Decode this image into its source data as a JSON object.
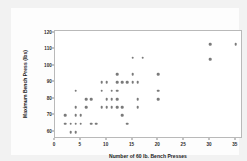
{
  "chart_data": {
    "type": "scatter",
    "title": "",
    "xlabel": "Number of 60 lb. Bench Presses",
    "ylabel": "Maximum Bench Press (lbs)",
    "xlim": [
      0,
      36
    ],
    "ylim": [
      57,
      121
    ],
    "grid": false,
    "legend": null,
    "marker_color": "#7a7a7a",
    "marker_shape": "circle",
    "xticks": [
      0,
      5,
      10,
      15,
      20,
      25,
      30,
      35
    ],
    "xtick_labels": [
      "0",
      "5",
      "10",
      "15",
      "20",
      "25",
      "30",
      "35"
    ],
    "yticks": [
      60,
      70,
      80,
      90,
      100,
      110,
      120
    ],
    "ytick_labels": [
      "60",
      "70",
      "80",
      "90",
      "100",
      "110",
      "120"
    ],
    "series": [
      {
        "name": "Bench press data",
        "points": [
          [
            2,
            70
          ],
          [
            2,
            65
          ],
          [
            3,
            65
          ],
          [
            3,
            60
          ],
          [
            4,
            85
          ],
          [
            4,
            75
          ],
          [
            4,
            70
          ],
          [
            4,
            65
          ],
          [
            4,
            60
          ],
          [
            5,
            70
          ],
          [
            5,
            65
          ],
          [
            6,
            80
          ],
          [
            6,
            75
          ],
          [
            7,
            80
          ],
          [
            7,
            65
          ],
          [
            8,
            65
          ],
          [
            9,
            85
          ],
          [
            9,
            90
          ],
          [
            9,
            75
          ],
          [
            10,
            90
          ],
          [
            10,
            80
          ],
          [
            10,
            75
          ],
          [
            11,
            85
          ],
          [
            11,
            80
          ],
          [
            11,
            75
          ],
          [
            12,
            95
          ],
          [
            12,
            90
          ],
          [
            12,
            85
          ],
          [
            12,
            80
          ],
          [
            12,
            75
          ],
          [
            13,
            90
          ],
          [
            13,
            70
          ],
          [
            13,
            75
          ],
          [
            14,
            90
          ],
          [
            14,
            65
          ],
          [
            15,
            95
          ],
          [
            15,
            90
          ],
          [
            15,
            105
          ],
          [
            16,
            90
          ],
          [
            16,
            80
          ],
          [
            16,
            75
          ],
          [
            17,
            105
          ],
          [
            20,
            95
          ],
          [
            20,
            85
          ],
          [
            20,
            80
          ],
          [
            30,
            113
          ],
          [
            30,
            104
          ],
          [
            35,
            113
          ]
        ]
      }
    ]
  },
  "axes": {
    "x": {
      "label": "Number of 60 lb. Bench Presses",
      "ticks": [
        "0",
        "5",
        "10",
        "15",
        "20",
        "25",
        "30",
        "35"
      ]
    },
    "y": {
      "label": "Maximum Bench Press (lbs)",
      "ticks": [
        "60",
        "70",
        "80",
        "90",
        "100",
        "110",
        "120"
      ]
    }
  },
  "colors": {
    "marker": "#7a7a7a",
    "frame": "#b9b9b9",
    "background": "#f2f2f2",
    "plot_background": "#ffffff",
    "text": "#1a1a1a"
  }
}
